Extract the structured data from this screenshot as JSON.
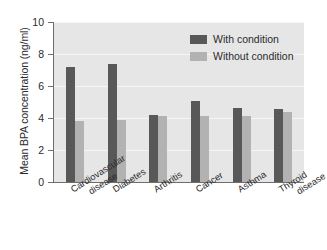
{
  "chart_data": {
    "type": "bar",
    "title": "",
    "subtitle": "",
    "xlabel": "",
    "ylabel": "Mean BPA concentration (ng/ml)",
    "ylim": [
      0,
      10
    ],
    "yticks": [
      0,
      2,
      4,
      6,
      8,
      10
    ],
    "ytick_labels": [
      "0",
      "2",
      "4",
      "6",
      "8",
      "10"
    ],
    "grid": true,
    "legend_position": "top-right",
    "categories": [
      "Cardiovascular disease",
      "Diabetes",
      "Arthritis",
      "Cancer",
      "Asthma",
      "Thyroid disease"
    ],
    "category_lines": [
      [
        "Cardiovascular",
        "disease"
      ],
      [
        "Diabetes"
      ],
      [
        "Arthritis"
      ],
      [
        "Cancer"
      ],
      [
        "Asthma"
      ],
      [
        "Thyroid",
        "disease"
      ]
    ],
    "series": [
      {
        "name": "With condition",
        "color": "#585858",
        "values": [
          7.2,
          7.35,
          4.2,
          5.05,
          4.65,
          4.55
        ]
      },
      {
        "name": "Without condition",
        "color": "#b2b2b2",
        "values": [
          3.8,
          3.9,
          4.1,
          4.15,
          4.15,
          4.4
        ]
      }
    ]
  },
  "legend": {
    "items": [
      {
        "label": "With condition",
        "color": "#585858"
      },
      {
        "label": "Without condition",
        "color": "#b2b2b2"
      }
    ]
  },
  "colors": {
    "plot_background": "#e6e6e6",
    "gridline": "#f5f5f5",
    "axis": "#6e6e6e",
    "text": "#2b2b2b",
    "page_background": "#ffffff"
  }
}
